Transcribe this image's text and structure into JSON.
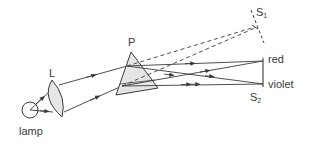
{
  "diagram": {
    "type": "optics-prism-spectrum",
    "components": {
      "lamp": {
        "label": "lamp"
      },
      "lens": {
        "label": "L"
      },
      "prism": {
        "label": "P"
      },
      "screen1": {
        "label": "S",
        "subscript": "1"
      },
      "screen2": {
        "label": "S",
        "subscript": "2"
      }
    },
    "spectrum_labels": {
      "top": "red",
      "bottom": "violet"
    },
    "colors": {
      "line": "#3a3a3a",
      "fill": "#e6e6e6"
    }
  }
}
